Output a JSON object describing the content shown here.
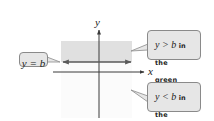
{
  "diagram": {
    "type": "inequality-graph",
    "axes": {
      "x_label": "x",
      "y_label": "y"
    },
    "boundary_line": {
      "equation": "y = b",
      "style": "solid",
      "arrows": "both"
    },
    "regions": [
      {
        "name": "green region",
        "inequality": "y > b",
        "fill": "#e0e0e0"
      },
      {
        "name": "yellow region",
        "inequality": "y < b",
        "fill": "#fbfbfb"
      }
    ],
    "colors": {
      "axis": "#3a3a3a",
      "line": "#5a5a5a",
      "callout_bg": "#e6e6e6",
      "callout_border": "#8a8a8a"
    }
  },
  "callouts": {
    "line_label": {
      "math": "y = b"
    },
    "above": {
      "math": "y > b",
      "text1": " in the",
      "text2": "green region."
    },
    "below": {
      "math": "y < b",
      "text1": " in the",
      "text2": "yellow region."
    }
  }
}
